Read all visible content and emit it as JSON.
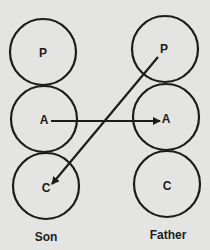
{
  "diagram": {
    "type": "transactional-analysis",
    "colors": {
      "background": "#e4e4e2",
      "ink": "#1c1c1c"
    },
    "columns": [
      {
        "id": "son",
        "label": "Son",
        "states": [
          {
            "id": "son-P",
            "label": "P"
          },
          {
            "id": "son-A",
            "label": "A"
          },
          {
            "id": "son-C",
            "label": "C"
          }
        ]
      },
      {
        "id": "father",
        "label": "Father",
        "states": [
          {
            "id": "father-P",
            "label": "P"
          },
          {
            "id": "father-A",
            "label": "A"
          },
          {
            "id": "father-C",
            "label": "C"
          }
        ]
      }
    ],
    "edges": [
      {
        "from": "son-A",
        "to": "father-A"
      },
      {
        "from": "father-P",
        "to": "son-C"
      }
    ]
  }
}
